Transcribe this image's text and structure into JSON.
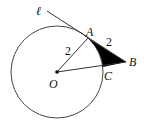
{
  "diagram": {
    "type": "geometry",
    "circle": {
      "center_label": "O",
      "radius_label": "2"
    },
    "tangent_line": {
      "label": "ℓ"
    },
    "points": {
      "A": "A",
      "B": "B",
      "C": "C",
      "O": "O"
    },
    "segment_labels": {
      "OA": "2",
      "AB": "2"
    },
    "shaded_region": "region bounded by AB, BC and arc AC",
    "colors": {
      "stroke": "#333333",
      "fill": "#000000",
      "background": "#ffffff"
    }
  }
}
